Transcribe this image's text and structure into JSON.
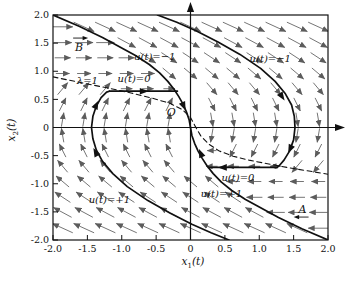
{
  "figure": {
    "background": "#ffffff",
    "ink_color": "#111111",
    "field_arrow_color": "#5c5c5c",
    "x_axis": {
      "label_base": "x",
      "label_sub": "1",
      "label_rest": "(t)",
      "ticks": [
        "-2.0",
        "-1.5",
        "-1.0",
        "-0.5",
        "0",
        "0.5",
        "1.0",
        "1.5",
        "2.0"
      ]
    },
    "y_axis": {
      "label_base": "x",
      "label_sub": "2",
      "label_rest": "(t)",
      "ticks": [
        "2.0",
        "1.5",
        "1.0",
        "0.5",
        "0",
        "-0.5",
        "-1.0",
        "-1.5",
        "-2.0"
      ]
    }
  },
  "chart_data": {
    "type": "line",
    "title": "",
    "xlabel": "x1(t)",
    "ylabel": "x2(t)",
    "xlim": [
      -2,
      2
    ],
    "ylim": [
      -2,
      2
    ],
    "grid": false,
    "series": [
      {
        "name": "switching-curve-upper",
        "style": "solid",
        "points": [
          [
            -2,
            2
          ],
          [
            -1.62,
            1.8
          ],
          [
            -1.28,
            1.6
          ],
          [
            -0.98,
            1.4
          ],
          [
            -0.8,
            1.28
          ],
          [
            -0.6,
            1.12
          ],
          [
            -0.45,
            0.97
          ],
          [
            -0.33,
            0.82
          ],
          [
            -0.24,
            0.68
          ],
          [
            -0.17,
            0.55
          ],
          [
            -0.11,
            0.42
          ],
          [
            -0.06,
            0.28
          ],
          [
            -0.02,
            0.14
          ],
          [
            0,
            0
          ]
        ]
      },
      {
        "name": "switching-curve-lower",
        "style": "solid",
        "points": [
          [
            0,
            0
          ],
          [
            0.02,
            -0.14
          ],
          [
            0.06,
            -0.28
          ],
          [
            0.11,
            -0.42
          ],
          [
            0.17,
            -0.55
          ],
          [
            0.24,
            -0.68
          ],
          [
            0.33,
            -0.82
          ],
          [
            0.45,
            -0.97
          ],
          [
            0.6,
            -1.12
          ],
          [
            0.8,
            -1.28
          ],
          [
            0.98,
            -1.4
          ],
          [
            1.28,
            -1.6
          ],
          [
            1.62,
            -1.8
          ],
          [
            2,
            -2
          ]
        ]
      },
      {
        "name": "switch-locus-dashed",
        "style": "dashed",
        "points": [
          [
            -2,
            0.9
          ],
          [
            -1.6,
            0.8
          ],
          [
            -1.2,
            0.7
          ],
          [
            -0.85,
            0.61
          ],
          [
            -0.55,
            0.52
          ],
          [
            -0.3,
            0.43
          ],
          [
            -0.12,
            0.32
          ],
          [
            0,
            0.18
          ],
          [
            0.07,
            0.02
          ],
          [
            0.15,
            -0.15
          ],
          [
            0.27,
            -0.3
          ],
          [
            0.42,
            -0.42
          ],
          [
            0.62,
            -0.51
          ],
          [
            0.85,
            -0.58
          ],
          [
            1.1,
            -0.64
          ],
          [
            1.4,
            -0.71
          ],
          [
            1.7,
            -0.77
          ],
          [
            2,
            -0.83
          ]
        ]
      },
      {
        "name": "trajectory-left-u-plus1",
        "style": "solid",
        "points": [
          [
            0.56,
            -2
          ],
          [
            0.3,
            -1.87
          ],
          [
            0.02,
            -1.72
          ],
          [
            -0.3,
            -1.52
          ],
          [
            -0.62,
            -1.3
          ],
          [
            -0.92,
            -1.05
          ],
          [
            -1.13,
            -0.82
          ],
          [
            -1.28,
            -0.6
          ],
          [
            -1.37,
            -0.4
          ],
          [
            -1.42,
            -0.2
          ],
          [
            -1.44,
            0
          ],
          [
            -1.42,
            0.2
          ],
          [
            -1.37,
            0.38
          ],
          [
            -1.3,
            0.53
          ],
          [
            -1.22,
            0.63
          ],
          [
            -1.18,
            0.645
          ]
        ]
      },
      {
        "name": "coast-arc-upper-u0",
        "style": "solid",
        "points": [
          [
            -1.18,
            0.645
          ],
          [
            -0.19,
            0.645
          ]
        ]
      },
      {
        "name": "trajectory-right-u-minus1",
        "style": "solid",
        "points": [
          [
            -0.48,
            2
          ],
          [
            -0.2,
            1.87
          ],
          [
            0.08,
            1.72
          ],
          [
            0.4,
            1.52
          ],
          [
            0.72,
            1.3
          ],
          [
            1.02,
            1.05
          ],
          [
            1.23,
            0.82
          ],
          [
            1.38,
            0.6
          ],
          [
            1.47,
            0.4
          ],
          [
            1.51,
            0.2
          ],
          [
            1.52,
            0
          ],
          [
            1.5,
            -0.22
          ],
          [
            1.44,
            -0.42
          ],
          [
            1.36,
            -0.58
          ],
          [
            1.29,
            -0.68
          ],
          [
            1.26,
            -0.71
          ]
        ]
      },
      {
        "name": "coast-arc-lower-u0",
        "style": "solid",
        "points": [
          [
            1.26,
            -0.71
          ],
          [
            0.26,
            -0.71
          ]
        ]
      }
    ],
    "flow_arrowheads": [
      {
        "x": -1.38,
        "y": -0.44,
        "dx": -0.44,
        "dy": 1
      },
      {
        "x": -1.37,
        "y": 0.4,
        "dx": 0.4,
        "dy": 1
      },
      {
        "x": -0.68,
        "y": 0.645,
        "dx": 1,
        "dy": 0
      },
      {
        "x": -0.1,
        "y": 0.38,
        "dx": 0.36,
        "dy": -1
      },
      {
        "x": 1.33,
        "y": 0.55,
        "dx": 0.55,
        "dy": -1
      },
      {
        "x": 1.45,
        "y": -0.38,
        "dx": -0.38,
        "dy": -1
      },
      {
        "x": 0.47,
        "y": -0.71,
        "dx": -1,
        "dy": 0
      },
      {
        "x": 0.15,
        "y": -0.46,
        "dx": -0.33,
        "dy": 1
      }
    ],
    "annotations": [
      {
        "text": "B",
        "x": -1.62,
        "y": 1.43,
        "decor": "arrow-over",
        "size": 11
      },
      {
        "text": "A",
        "x": 1.63,
        "y": -1.45,
        "decor": "arrow-under",
        "size": 11
      },
      {
        "text": "λ=1",
        "x": -1.5,
        "y": 0.83,
        "decor": "none",
        "size": 10
      },
      {
        "text": "u(t)=0",
        "x": -0.82,
        "y": 0.87,
        "decor": "none",
        "size": 10
      },
      {
        "text": "u(t)=−1",
        "x": -0.52,
        "y": 1.27,
        "decor": "none",
        "size": 10
      },
      {
        "text": "u(t)=−1",
        "x": 1.16,
        "y": 1.22,
        "decor": "none",
        "size": 10
      },
      {
        "text": "u(t)=+1",
        "x": -1.18,
        "y": -1.28,
        "decor": "none",
        "size": 10
      },
      {
        "text": "u(t)=+1",
        "x": 0.45,
        "y": -1.17,
        "decor": "none",
        "size": 10
      },
      {
        "text": "u(t)=0",
        "x": 0.69,
        "y": -0.88,
        "decor": "none",
        "size": 10
      },
      {
        "text": "O",
        "x": -0.28,
        "y": 0.26,
        "decor": "none",
        "size": 11
      }
    ],
    "vector_field": {
      "description": "closed-loop flow direction = (x2, u); u=-1 right of upper switching curve (and above dashed locus for x2<0), u=+1 left of lower switching curve (and below dashed locus for x2>0), u=0 between dashed locus and switching curves",
      "cols_x0": -1.86,
      "cols_dx": 0.31,
      "cols_n": 13,
      "rows_y": [
        -1.79,
        -1.51,
        -1.24,
        -0.96,
        -0.69,
        -0.41,
        -0.14,
        0.14,
        0.41,
        0.69,
        0.96,
        1.24,
        1.51,
        1.79
      ],
      "len_base": 6,
      "len_per_speed": 8,
      "len_max": 25
    }
  }
}
